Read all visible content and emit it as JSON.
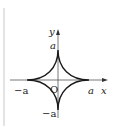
{
  "figure": {
    "axis_labels": {
      "x": "x",
      "y": "y"
    },
    "origin_label": "O",
    "tick_labels": {
      "pos_x": "a",
      "neg_x": "−a",
      "pos_y": "a",
      "neg_y": "−a"
    },
    "colors": {
      "curve": "#1a1a1a",
      "axes": "#555555",
      "margin_line": "#c8c8c8"
    }
  }
}
